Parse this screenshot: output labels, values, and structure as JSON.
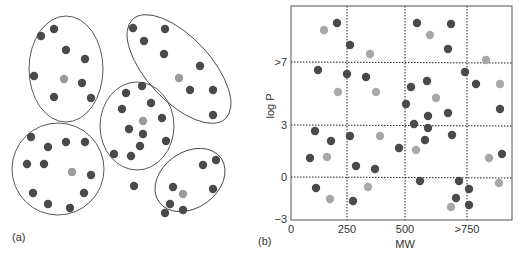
{
  "figure": {
    "panel_a_label": "(a)",
    "panel_b_label": "(b)",
    "colors": {
      "dark_point": "#4a4a4a",
      "light_point": "#a8a8a8",
      "centroid_point": "#9a9a9a",
      "outline": "#444444",
      "grid": "#222222"
    }
  },
  "panel_a": {
    "description": "Clusters of compounds enclosed in ellipses, each with a lighter centroid representative",
    "clusters": [
      {
        "name": "top-left",
        "ellipse": {
          "cx": 66,
          "cy": 69,
          "rx": 37,
          "ry": 53,
          "rot": 0
        },
        "points": [
          [
            41,
            36
          ],
          [
            54,
            29
          ],
          [
            66,
            50
          ],
          [
            85,
            59
          ],
          [
            34,
            76
          ],
          [
            82,
            83
          ],
          [
            54,
            97
          ],
          [
            91,
            98
          ]
        ],
        "centroid": [
          64,
          79
        ]
      },
      {
        "name": "top-right",
        "ellipse": {
          "cx": 179,
          "cy": 69,
          "rx": 68,
          "ry": 32,
          "rot": 47
        },
        "points": [
          [
            133,
            28
          ],
          [
            165,
            29
          ],
          [
            144,
            41
          ],
          [
            164,
            54
          ],
          [
            200,
            66
          ],
          [
            190,
            90
          ],
          [
            213,
            90
          ],
          [
            213,
            115
          ]
        ],
        "centroid": [
          179,
          78
        ]
      },
      {
        "name": "center",
        "ellipse": {
          "cx": 137,
          "cy": 126,
          "rx": 37,
          "ry": 44,
          "rot": 0
        },
        "points": [
          [
            126,
            93
          ],
          [
            142,
            86
          ],
          [
            122,
            109
          ],
          [
            151,
            103
          ],
          [
            162,
            118
          ],
          [
            129,
            129
          ],
          [
            143,
            134
          ],
          [
            166,
            141
          ],
          [
            140,
            146
          ],
          [
            114,
            154
          ],
          [
            131,
            156
          ]
        ],
        "centroid": [
          143,
          121
        ]
      },
      {
        "name": "bottom-left",
        "ellipse": {
          "cx": 58,
          "cy": 169,
          "rx": 46,
          "ry": 46,
          "rot": 0
        },
        "points": [
          [
            31,
            137
          ],
          [
            48,
            147
          ],
          [
            66,
            142
          ],
          [
            85,
            142
          ],
          [
            27,
            164
          ],
          [
            44,
            164
          ],
          [
            91,
            175
          ],
          [
            33,
            193
          ],
          [
            84,
            193
          ],
          [
            48,
            204
          ],
          [
            70,
            208
          ]
        ],
        "centroid": [
          72,
          172
        ]
      },
      {
        "name": "bottom-right",
        "ellipse": {
          "cx": 190,
          "cy": 180,
          "rx": 38,
          "ry": 28,
          "rot": -35
        },
        "points": [
          [
            203,
            165
          ],
          [
            216,
            160
          ],
          [
            173,
            187
          ],
          [
            213,
            189
          ],
          [
            170,
            204
          ],
          [
            165,
            213
          ],
          [
            183,
            210
          ]
        ],
        "centroid": [
          183,
          194
        ]
      }
    ],
    "outliers": [
      [
        134,
        186
      ]
    ]
  },
  "chart_data": {
    "type": "scatter",
    "title": "",
    "xlabel": "MW",
    "ylabel": "log P",
    "x_ticks": [
      "0",
      "250",
      "500",
      ">750"
    ],
    "y_ticks": [
      ">7",
      "3",
      "0",
      "−3"
    ],
    "xlim": [
      0,
      1000
    ],
    "ylim": [
      -3,
      10
    ],
    "grid": "dotted lines at MW 250, 500, 750 and log P 0, 3, 7",
    "legend": "none",
    "note": "Grid cells partition chemical property space; points shaded dark vs light",
    "series": [
      {
        "name": "dark",
        "points": [
          {
            "mw": 205,
            "logp": 9.0
          },
          {
            "mw": 255,
            "logp": 7.6
          },
          {
            "mw": 560,
            "logp": 9.0
          },
          {
            "mw": 700,
            "logp": 9.0
          },
          {
            "mw": 690,
            "logp": 7.9
          },
          {
            "mw": 115,
            "logp": 6.3
          },
          {
            "mw": 245,
            "logp": 6.1
          },
          {
            "mw": 315,
            "logp": 5.9
          },
          {
            "mw": 520,
            "logp": 5.3
          },
          {
            "mw": 600,
            "logp": 5.7
          },
          {
            "mw": 760,
            "logp": 6.1
          },
          {
            "mw": 810,
            "logp": 5.5
          },
          {
            "mw": 505,
            "logp": 4.3
          },
          {
            "mw": 690,
            "logp": 3.6
          },
          {
            "mw": 910,
            "logp": 3.8
          },
          {
            "mw": 600,
            "logp": 3.4
          },
          {
            "mw": 545,
            "logp": 3.0
          },
          {
            "mw": 600,
            "logp": 2.8
          },
          {
            "mw": 105,
            "logp": 2.6
          },
          {
            "mw": 255,
            "logp": 2.3
          },
          {
            "mw": 700,
            "logp": 2.3
          },
          {
            "mw": 175,
            "logp": 2.0
          },
          {
            "mw": 590,
            "logp": 2.1
          },
          {
            "mw": 470,
            "logp": 1.7
          },
          {
            "mw": 80,
            "logp": 1.1
          },
          {
            "mw": 920,
            "logp": 1.3
          },
          {
            "mw": 285,
            "logp": 0.6
          },
          {
            "mw": 360,
            "logp": 0.4
          },
          {
            "mw": 565,
            "logp": -0.2
          },
          {
            "mw": 730,
            "logp": -0.3
          },
          {
            "mw": 770,
            "logp": -0.8
          },
          {
            "mw": 110,
            "logp": -0.7
          },
          {
            "mw": 270,
            "logp": -1.7
          },
          {
            "mw": 710,
            "logp": -1.5
          },
          {
            "mw": 765,
            "logp": -2.0
          }
        ]
      },
      {
        "name": "light",
        "points": [
          {
            "mw": 150,
            "logp": 8.6
          },
          {
            "mw": 345,
            "logp": 7.5
          },
          {
            "mw": 605,
            "logp": 8.5
          },
          {
            "mw": 860,
            "logp": 7.1
          },
          {
            "mw": 205,
            "logp": 5.1
          },
          {
            "mw": 365,
            "logp": 5.0
          },
          {
            "mw": 910,
            "logp": 5.5
          },
          {
            "mw": 640,
            "logp": 4.7
          },
          {
            "mw": 340,
            "logp": 2.4
          },
          {
            "mw": 555,
            "logp": 1.6
          },
          {
            "mw": 160,
            "logp": 1.2
          },
          {
            "mw": 870,
            "logp": 1.1
          },
          {
            "mw": 335,
            "logp": -0.6
          },
          {
            "mw": 905,
            "logp": -0.4
          },
          {
            "mw": 175,
            "logp": -1.5
          },
          {
            "mw": 685,
            "logp": -2.1
          }
        ]
      }
    ],
    "pixel_points": {
      "dark": [
        [
          337,
          23
        ],
        [
          350,
          45
        ],
        [
          417,
          23
        ],
        [
          451,
          24
        ],
        [
          448,
          49
        ],
        [
          318,
          70
        ],
        [
          347,
          74
        ],
        [
          366,
          77
        ],
        [
          411,
          87
        ],
        [
          427,
          81
        ],
        [
          465,
          72
        ],
        [
          476,
          84
        ],
        [
          406,
          104
        ],
        [
          448,
          113
        ],
        [
          500,
          109
        ],
        [
          428,
          116
        ],
        [
          414,
          124
        ],
        [
          428,
          128
        ],
        [
          315,
          131
        ],
        [
          350,
          136
        ],
        [
          452,
          135
        ],
        [
          331,
          141
        ],
        [
          425,
          140
        ],
        [
          399,
          148
        ],
        [
          310,
          158
        ],
        [
          502,
          154
        ],
        [
          356,
          166
        ],
        [
          375,
          169
        ],
        [
          420,
          181
        ],
        [
          459,
          181
        ],
        [
          469,
          189
        ],
        [
          316,
          188
        ],
        [
          353,
          201
        ],
        [
          456,
          198
        ],
        [
          469,
          205
        ]
      ],
      "light": [
        [
          324,
          30
        ],
        [
          370,
          54
        ],
        [
          430,
          35
        ],
        [
          486,
          60
        ],
        [
          338,
          92
        ],
        [
          376,
          92
        ],
        [
          500,
          84
        ],
        [
          436,
          98
        ],
        [
          380,
          136
        ],
        [
          416,
          150
        ],
        [
          327,
          157
        ],
        [
          489,
          158
        ],
        [
          368,
          187
        ],
        [
          499,
          183
        ],
        [
          330,
          199
        ],
        [
          451,
          207
        ]
      ]
    }
  }
}
